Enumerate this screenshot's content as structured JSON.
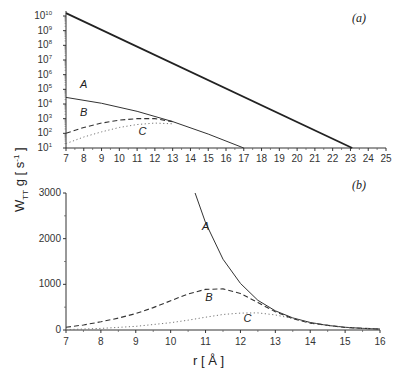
{
  "chart_data": [
    {
      "panel": "(a)",
      "type": "line",
      "yscale": "log",
      "xlabel": "r [Å]",
      "ylabel": "W_TT g [s^-1]",
      "xlim": [
        7,
        25
      ],
      "ylim_exp": [
        1,
        10
      ],
      "xticks": [
        7,
        8,
        9,
        10,
        11,
        12,
        13,
        14,
        15,
        16,
        17,
        18,
        19,
        20,
        21,
        22,
        23,
        24,
        25
      ],
      "yticks_exp": [
        1,
        2,
        3,
        4,
        5,
        6,
        7,
        8,
        9,
        10
      ],
      "series": [
        {
          "name": "total",
          "style": "thick",
          "x": [
            7,
            23.1
          ],
          "log10y": [
            10.2,
            1
          ]
        },
        {
          "name": "A",
          "style": "solid",
          "x": [
            7,
            9,
            11,
            13,
            15,
            17
          ],
          "log10y": [
            4.45,
            4.05,
            3.5,
            2.8,
            1.95,
            1
          ]
        },
        {
          "name": "B",
          "style": "dashed",
          "x": [
            7,
            8,
            9,
            10,
            11,
            12,
            13
          ],
          "log10y": [
            2.0,
            2.4,
            2.7,
            2.9,
            3.0,
            3.0,
            2.8
          ]
        },
        {
          "name": "C",
          "style": "dotted",
          "x": [
            7,
            8,
            9,
            10,
            11,
            12,
            13
          ],
          "log10y": [
            1.3,
            1.75,
            2.1,
            2.4,
            2.6,
            2.7,
            2.65
          ]
        }
      ],
      "annotations": [
        {
          "text": "A",
          "x": 8.0,
          "log10y": 5.1
        },
        {
          "text": "B",
          "x": 8.0,
          "log10y": 3.2
        },
        {
          "text": "C",
          "x": 11.3,
          "log10y": 1.9
        }
      ]
    },
    {
      "panel": "(b)",
      "type": "line",
      "yscale": "linear",
      "xlabel": "r [Å]",
      "xlim": [
        7,
        16
      ],
      "ylim": [
        0,
        3000
      ],
      "xticks": [
        7,
        8,
        9,
        10,
        11,
        12,
        13,
        14,
        15,
        16
      ],
      "yticks": [
        0,
        1000,
        2000,
        3000
      ],
      "series": [
        {
          "name": "A",
          "style": "solid",
          "x": [
            10.7,
            11,
            11.5,
            12,
            12.5,
            13,
            13.5,
            14,
            14.5,
            15,
            15.5,
            16
          ],
          "y": [
            3000,
            2350,
            1550,
            1020,
            650,
            420,
            265,
            165,
            100,
            60,
            35,
            20
          ]
        },
        {
          "name": "B",
          "style": "dashed",
          "x": [
            7,
            7.5,
            8,
            8.5,
            9,
            9.5,
            10,
            10.5,
            11,
            11.5,
            12,
            12.5,
            13,
            13.5,
            14,
            15,
            16
          ],
          "y": [
            60,
            110,
            180,
            260,
            360,
            490,
            640,
            790,
            890,
            900,
            800,
            600,
            400,
            250,
            150,
            55,
            20
          ]
        },
        {
          "name": "C",
          "style": "dotted",
          "x": [
            7,
            8,
            9,
            10,
            10.5,
            11,
            11.5,
            12,
            12.5,
            13,
            13.5,
            14,
            15,
            16
          ],
          "y": [
            8,
            35,
            80,
            160,
            215,
            280,
            340,
            370,
            375,
            330,
            250,
            160,
            55,
            20
          ]
        }
      ],
      "annotations": [
        {
          "text": "A",
          "x": 11.0,
          "y": 2200
        },
        {
          "text": "B",
          "x": 11.1,
          "y": 640
        },
        {
          "text": "C",
          "x": 12.2,
          "y": 170
        }
      ]
    }
  ],
  "labels": {
    "panel_a": "(a)",
    "panel_b": "(b)",
    "ylabel_main": "W",
    "ylabel_sub": "TT",
    "ylabel_rest": " g [ s",
    "ylabel_sup": "-1",
    "ylabel_end": " ]",
    "xlabel": "r [ Å ]"
  }
}
